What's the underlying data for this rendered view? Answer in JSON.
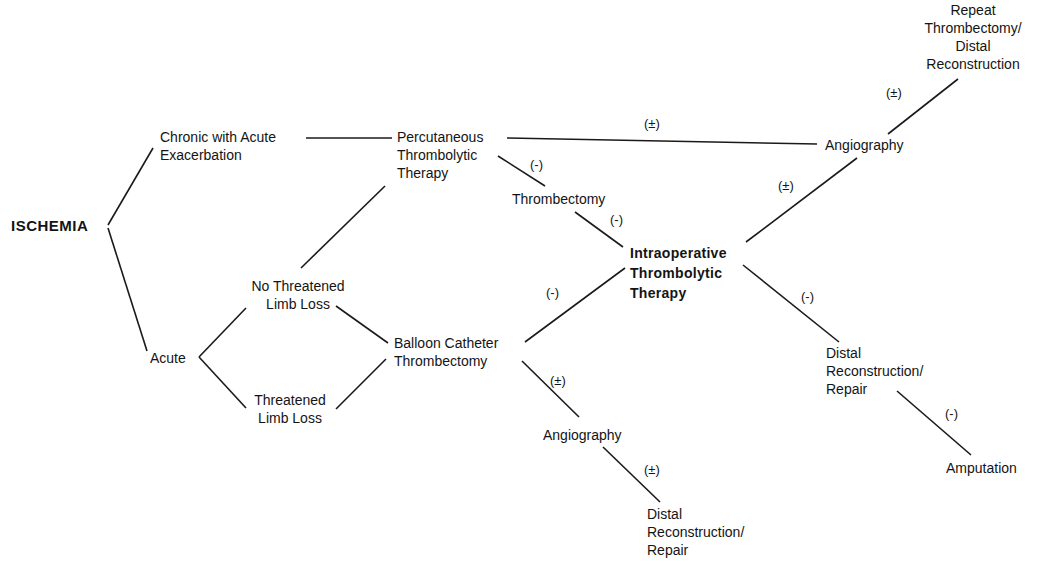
{
  "diagram": {
    "type": "flowchart",
    "nodes": {
      "ischemia": {
        "lines": [
          "ISCHEMIA"
        ]
      },
      "chronic": {
        "lines": [
          "Chronic with Acute",
          "Exacerbation"
        ]
      },
      "acute": {
        "lines": [
          "Acute"
        ]
      },
      "no_threat": {
        "lines": [
          "No Threatened",
          "Limb Loss"
        ]
      },
      "threat": {
        "lines": [
          "Threatened",
          "Limb Loss"
        ]
      },
      "ptt": {
        "lines": [
          "Percutaneous",
          "Thrombolytic",
          "Therapy"
        ]
      },
      "balloon": {
        "lines": [
          "Balloon Catheter",
          "Thrombectomy"
        ]
      },
      "thrombectomy": {
        "lines": [
          "Thrombectomy"
        ]
      },
      "iot": {
        "lines": [
          "Intraoperative",
          "Thrombolytic",
          "Therapy"
        ]
      },
      "angio_top": {
        "lines": [
          "Angiography"
        ]
      },
      "repeat": {
        "lines": [
          "Repeat",
          "Thrombectomy/",
          "Distal",
          "Reconstruction"
        ]
      },
      "distal_right": {
        "lines": [
          "Distal",
          "Reconstruction/",
          "Repair"
        ]
      },
      "amputation": {
        "lines": [
          "Amputation"
        ]
      },
      "angio_bottom": {
        "lines": [
          "Angiography"
        ]
      },
      "distal_bottom": {
        "lines": [
          "Distal",
          "Reconstruction/",
          "Repair"
        ]
      }
    },
    "edge_labels": {
      "ptt_angio": "(±)",
      "ptt_thrombectomy": "(-)",
      "thrombectomy_iot": "(-)",
      "balloon_iot": "(-)",
      "iot_angio": "(±)",
      "angio_repeat": "(±)",
      "iot_distal": "(-)",
      "distal_amputation": "(-)",
      "balloon_angio": "(±)",
      "angio_distal": "(±)"
    }
  }
}
